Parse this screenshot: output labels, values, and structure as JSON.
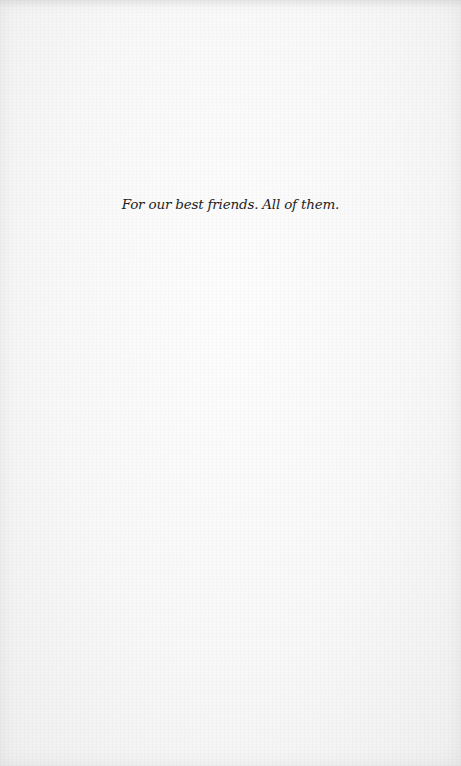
{
  "page": {
    "background_color": "#f7f7f7",
    "text_color": "#1e1e1e"
  },
  "dedication": {
    "text": "For our best friends. All of them."
  }
}
